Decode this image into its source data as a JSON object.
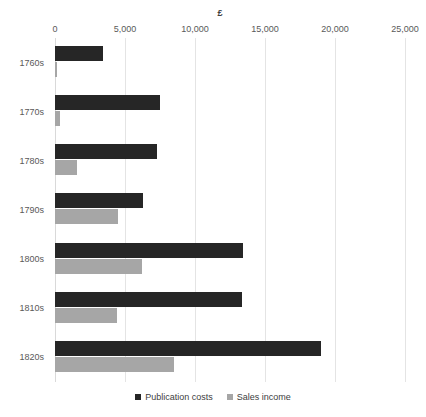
{
  "chart_data": {
    "type": "bar",
    "orientation": "horizontal",
    "title": "£",
    "xlabel": "",
    "ylabel": "",
    "xlim": [
      0,
      25000
    ],
    "grid": true,
    "legend_position": "bottom",
    "xticks": [
      "0",
      "5,000",
      "10,000",
      "15,000",
      "20,000",
      "25,000"
    ],
    "xtick_values": [
      0,
      5000,
      10000,
      15000,
      20000,
      25000
    ],
    "categories": [
      "1760s",
      "1770s",
      "1780s",
      "1790s",
      "1800s",
      "1810s",
      "1820s"
    ],
    "series": [
      {
        "name": "Publication costs",
        "color": "#262626",
        "values": [
          3400,
          7500,
          7300,
          6300,
          13400,
          13350,
          19000
        ]
      },
      {
        "name": "Sales income",
        "color": "#a6a6a6",
        "values": [
          150,
          350,
          1600,
          4500,
          6200,
          4400,
          8500
        ]
      }
    ]
  },
  "colors": {
    "gridline": "#e4e4e4",
    "axis_line": "#d9d9d9",
    "tick_text": "#595959",
    "legend_text": "#404040",
    "background": "#ffffff"
  }
}
